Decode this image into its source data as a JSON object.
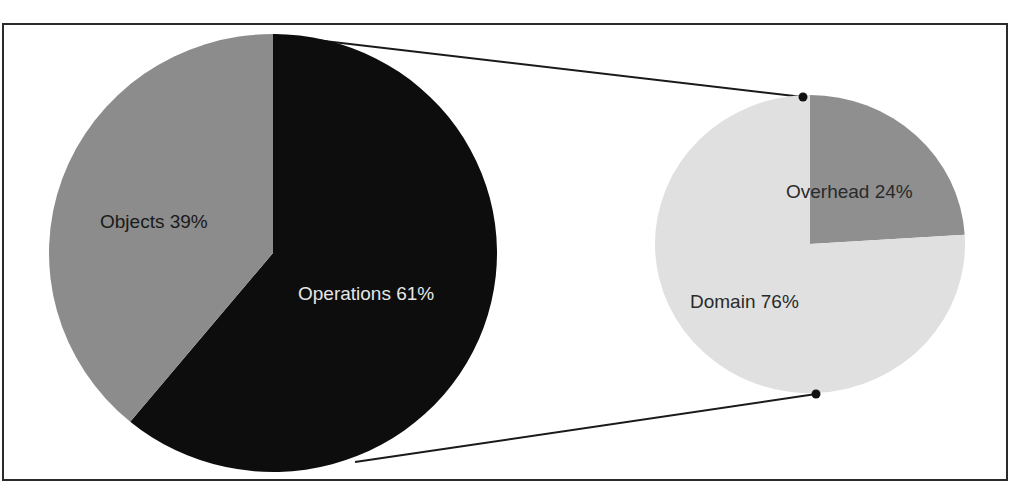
{
  "chart_data": {
    "type": "pie",
    "subtype": "pie-of-pie",
    "title": "",
    "main_pie": {
      "slices": [
        {
          "label": "Operations",
          "value": 61,
          "display": "Operations 61%",
          "color": "#0d0d0d",
          "text_color": "#e6e6e6"
        },
        {
          "label": "Objects",
          "value": 39,
          "display": "Objects 39%",
          "color": "#8c8c8c",
          "text_color": "#1a1a1a"
        }
      ]
    },
    "secondary_pie": {
      "breaks_down": "Operations",
      "slices": [
        {
          "label": "Overhead",
          "value": 24,
          "display": "Overhead 24%",
          "color": "#8f8f8f",
          "text_color": "#2a2a2a"
        },
        {
          "label": "Domain",
          "value": 76,
          "display": "Domain 76%",
          "color": "#e0e0e0",
          "text_color": "#2a2a2a"
        }
      ]
    },
    "legend": "none",
    "data_labels": "inside, category name + percentage"
  }
}
